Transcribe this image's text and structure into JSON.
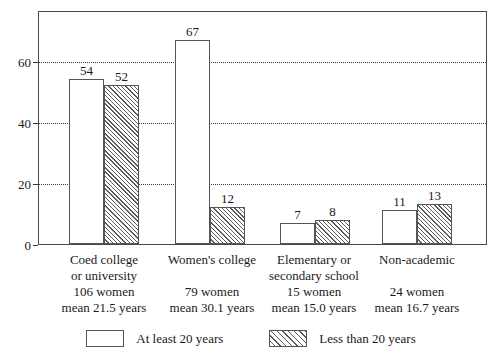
{
  "chart_data": {
    "type": "bar",
    "title": "",
    "subtitle": "",
    "xlabel": "",
    "ylabel": "",
    "ylim": [
      0,
      77
    ],
    "yticks": [
      0,
      20,
      40,
      60
    ],
    "ytick_labels": [
      "0",
      "20",
      "40",
      "60"
    ],
    "grid": true,
    "grid_style": "dotted-horizontal",
    "legend_position": "bottom-center",
    "categories": [
      "Coed college or university",
      "Women's college",
      "Elementary or secondary school",
      "Non-academic"
    ],
    "series": [
      {
        "name": "At least 20 years",
        "fill": "white",
        "values": [
          54,
          67,
          7,
          11
        ]
      },
      {
        "name": "Less than 20 years",
        "fill": "diagonal-hatch",
        "values": [
          52,
          12,
          8,
          13
        ]
      }
    ]
  },
  "axis": {
    "yticks": [
      {
        "label": "60",
        "value": 60
      },
      {
        "label": "40",
        "value": 40
      },
      {
        "label": "20",
        "value": 20
      },
      {
        "label": "0",
        "value": 0
      }
    ]
  },
  "groups": [
    {
      "lines": [
        "Coed college",
        "or university",
        "106 women",
        "mean 21.5 years"
      ],
      "bars": [
        {
          "value": 54,
          "label": "54",
          "style": "plain"
        },
        {
          "value": 52,
          "label": "52",
          "style": "hatched"
        }
      ]
    },
    {
      "lines": [
        "Women's college",
        "",
        "79 women",
        "mean 30.1 years"
      ],
      "bars": [
        {
          "value": 67,
          "label": "67",
          "style": "plain"
        },
        {
          "value": 12,
          "label": "12",
          "style": "hatched"
        }
      ]
    },
    {
      "lines": [
        "Elementary or",
        "secondary school",
        "15 women",
        "mean 15.0 years"
      ],
      "bars": [
        {
          "value": 7,
          "label": "7",
          "style": "plain"
        },
        {
          "value": 8,
          "label": "8",
          "style": "hatched"
        }
      ]
    },
    {
      "lines": [
        "Non-academic",
        "",
        "24 women",
        "mean 16.7 years"
      ],
      "bars": [
        {
          "value": 11,
          "label": "11",
          "style": "plain"
        },
        {
          "value": 13,
          "label": "13",
          "style": "hatched"
        }
      ]
    }
  ],
  "legend": {
    "entries": [
      {
        "label": "At least 20 years",
        "style": "plain"
      },
      {
        "label": "Less than 20 years",
        "style": "hatched"
      }
    ]
  },
  "colors": {
    "frame": "#4a4a4a",
    "bar_outline": "#555555",
    "hatch": "#5a5a5a",
    "grid": "#3a3a3a",
    "background": "#ffffff",
    "text": "#1a1a1a"
  }
}
